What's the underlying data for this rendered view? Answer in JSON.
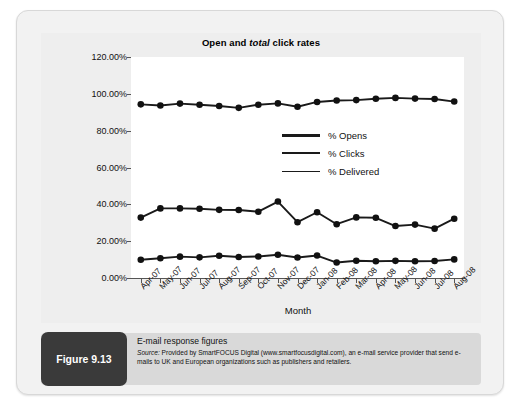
{
  "figure": {
    "tag_label": "Figure 9.13",
    "caption_title": "E-mail response figures",
    "source_prefix": "Source:",
    "source_body": " Provided by SmartFOCUS Digital (www.smartfocusdigital.com), an e-mail service provider that send e-mails to UK and European organizations such as publishers and retailers."
  },
  "colors": {
    "series_line": "#1a1a1a",
    "marker": "#111111",
    "panel_bg": "#eeeeee",
    "plot_bg": "#ffffff",
    "frame_bg": "#f2f2f2",
    "caption_bg": "#d9d9d9",
    "tag_bg": "#3a3a3a",
    "axis": "#555555"
  },
  "chart_data": {
    "type": "line",
    "title": "Open and total click rates",
    "title_plain_1": "Open and ",
    "title_italic": "total",
    "title_plain_2": " click rates",
    "xlabel": "Month",
    "ylabel": "",
    "ylim": [
      0,
      120
    ],
    "ytick_step": 20,
    "ytick_labels": [
      "0.00%",
      "20.00%",
      "40.00%",
      "60.00%",
      "80.00%",
      "100.00%",
      "120.00%"
    ],
    "ytick_values": [
      0,
      20,
      40,
      60,
      80,
      100,
      120
    ],
    "grid": false,
    "legend_position": "inside-right",
    "categories": [
      "Apr-07",
      "May-07",
      "Jun-07",
      "Jul-07",
      "Aug-07",
      "Sep-07",
      "Oct-07",
      "Nov-07",
      "Dec-07",
      "Jan-08",
      "Feb-08",
      "Mar-08",
      "Apr-08",
      "May-08",
      "Jun-08",
      "Jul-08",
      "Aug-08"
    ],
    "series": [
      {
        "name": "% Opens",
        "values": [
          32.8,
          37.8,
          37.8,
          37.6,
          37.0,
          36.9,
          36.0,
          41.5,
          30.3,
          35.7,
          29.2,
          32.9,
          32.7,
          28.2,
          29.0,
          26.8,
          32.2
        ]
      },
      {
        "name": "% Clicks",
        "values": [
          9.9,
          10.7,
          11.6,
          11.2,
          12.1,
          11.4,
          11.7,
          12.6,
          11.1,
          12.2,
          8.4,
          9.4,
          9.1,
          9.3,
          9.1,
          9.2,
          10.1
        ]
      },
      {
        "name": "% Delivered",
        "values": [
          94.3,
          93.7,
          94.7,
          94.1,
          93.4,
          92.4,
          94.1,
          94.8,
          93.0,
          95.6,
          96.4,
          96.6,
          97.3,
          97.8,
          97.4,
          97.2,
          95.8
        ]
      }
    ],
    "legend_entries": [
      "% Opens",
      "% Clicks",
      "% Delivered"
    ]
  }
}
